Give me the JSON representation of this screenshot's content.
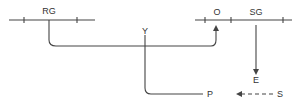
{
  "diagram": {
    "labels": {
      "rg": "RG",
      "y": "Y",
      "o": "O",
      "sg": "SG",
      "e": "E",
      "p": "P",
      "s": "S"
    },
    "colors": {
      "line": "#444444",
      "text": "#333333",
      "background": "#ffffff"
    },
    "edges": [
      {
        "from": "RG",
        "to": "O",
        "style": "solid",
        "arrow": "end"
      },
      {
        "from": "Y",
        "to": "P",
        "style": "solid",
        "arrow": "none"
      },
      {
        "from": "SG",
        "to": "E",
        "style": "solid",
        "arrow": "end"
      },
      {
        "from": "S",
        "to": "P",
        "style": "dashed",
        "arrow": "end"
      }
    ]
  }
}
